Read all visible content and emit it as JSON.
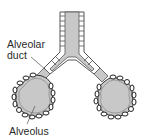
{
  "diagram": {
    "labels": {
      "alveolar_duct_line1": "Alveolar",
      "alveolar_duct_line2": "duct",
      "alveolus": "Alveolus"
    },
    "colors": {
      "fill": "#c8c8c8",
      "outline": "#555555",
      "background": "#ffffff"
    }
  }
}
